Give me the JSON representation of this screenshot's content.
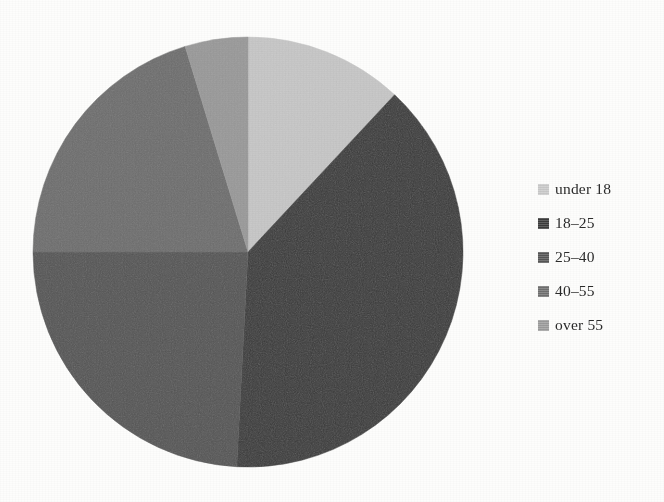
{
  "figure": {
    "background_color": "#fdfdfc",
    "kind": "pie-chart-figure"
  },
  "chart_data": {
    "type": "pie",
    "title": "",
    "subtitle": "",
    "xlabel": "",
    "ylabel": "",
    "grid": false,
    "legend_position": "right",
    "start_angle_deg": 0,
    "direction": "clockwise",
    "center_x": 245,
    "center_y": 252,
    "radius": 215,
    "categories": [
      "under 18",
      "18-25",
      "25-40",
      "40-55",
      "over 55"
    ],
    "labels": [
      "under 18",
      "18–25",
      "25–40",
      "40–55",
      "over 55"
    ],
    "values": [
      12,
      39,
      24,
      20,
      5
    ],
    "percentages": [
      12,
      39,
      24,
      20,
      5
    ],
    "angles_deg": [
      43,
      140,
      87,
      73,
      17
    ],
    "slice_boundaries_deg": [
      0,
      43,
      183,
      270,
      343,
      360
    ],
    "colors": [
      "#c8c8c8",
      "#3a3a3a",
      "#555555",
      "#6e6e6e",
      "#9a9a9a"
    ],
    "slices": [
      {
        "label": "under 18",
        "value": 12,
        "start_deg": 0,
        "end_deg": 43,
        "color": "#c8c8c8"
      },
      {
        "label": "18–25",
        "value": 39,
        "start_deg": 43,
        "end_deg": 183,
        "color": "#3a3a3a"
      },
      {
        "label": "25–40",
        "value": 24,
        "start_deg": 183,
        "end_deg": 270,
        "color": "#555555"
      },
      {
        "label": "40–55",
        "value": 20,
        "start_deg": 270,
        "end_deg": 343,
        "color": "#6e6e6e"
      },
      {
        "label": "over 55",
        "value": 5,
        "start_deg": 343,
        "end_deg": 360,
        "color": "#9a9a9a"
      }
    ]
  },
  "legend": {
    "items": [
      {
        "label": "under 18",
        "color": "#c8c8c8"
      },
      {
        "label": "18–25",
        "color": "#3a3a3a"
      },
      {
        "label": "25–40",
        "color": "#555555"
      },
      {
        "label": "40–55",
        "color": "#6e6e6e"
      },
      {
        "label": "over 55",
        "color": "#9a9a9a"
      }
    ]
  }
}
